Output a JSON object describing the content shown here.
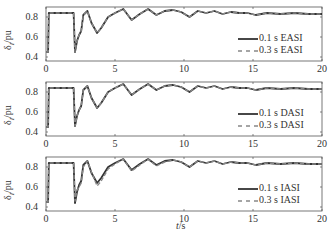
{
  "chart_data": [
    {
      "type": "line",
      "title": "",
      "xlabel": "",
      "ylabel": "δ/pu",
      "ylabel_subscript": "",
      "xlim": [
        0,
        20
      ],
      "ylim": [
        0.36,
        0.9
      ],
      "xticks": [
        "0",
        "5",
        "10",
        "15",
        "20"
      ],
      "yticks": [
        "0.4",
        "0.6",
        "0.8"
      ],
      "legend_position": "lower right",
      "series": [
        {
          "name": "0.1 s EASI",
          "style": "solid",
          "x": [
            0,
            0.15,
            0.2,
            2.0,
            2.1,
            2.25,
            2.4,
            2.55,
            2.7,
            3.0,
            3.3,
            3.7,
            4.0,
            4.5,
            5.0,
            5.6,
            6.2,
            6.8,
            7.4,
            8.0,
            8.6,
            9.2,
            9.8,
            10.4,
            11.0,
            11.6,
            12.2,
            12.8,
            13.4,
            14.0,
            14.6,
            15.2,
            16,
            17,
            18,
            19,
            20
          ],
          "y": [
            0.45,
            0.45,
            0.84,
            0.84,
            0.45,
            0.56,
            0.62,
            0.66,
            0.82,
            0.86,
            0.74,
            0.64,
            0.69,
            0.8,
            0.84,
            0.88,
            0.77,
            0.83,
            0.88,
            0.82,
            0.86,
            0.87,
            0.85,
            0.8,
            0.86,
            0.84,
            0.86,
            0.83,
            0.85,
            0.84,
            0.84,
            0.82,
            0.84,
            0.83,
            0.84,
            0.83,
            0.83
          ]
        },
        {
          "name": "0.3 s EASI",
          "style": "dashed",
          "x": [
            0,
            0.15,
            0.2,
            2.0,
            2.1,
            2.25,
            2.4,
            2.55,
            2.7,
            3.0,
            3.3,
            3.7,
            4.0,
            4.5,
            5.0,
            5.6,
            6.2,
            6.8,
            7.4,
            8.0,
            8.6,
            9.2,
            9.8,
            10.4,
            11.0,
            11.6,
            12.2,
            12.8,
            13.4,
            14.0,
            14.6,
            15.2,
            16,
            17,
            18,
            19,
            20
          ],
          "y": [
            0.45,
            0.45,
            0.84,
            0.84,
            0.45,
            0.56,
            0.62,
            0.66,
            0.82,
            0.86,
            0.74,
            0.64,
            0.69,
            0.8,
            0.84,
            0.88,
            0.77,
            0.83,
            0.88,
            0.82,
            0.86,
            0.87,
            0.85,
            0.8,
            0.86,
            0.84,
            0.86,
            0.83,
            0.85,
            0.84,
            0.84,
            0.82,
            0.84,
            0.83,
            0.84,
            0.83,
            0.83
          ]
        }
      ]
    },
    {
      "type": "line",
      "title": "",
      "xlabel": "",
      "ylabel": "δ/pu",
      "xlim": [
        0,
        20
      ],
      "ylim": [
        0.36,
        0.9
      ],
      "xticks": [
        "0",
        "5",
        "10",
        "15",
        "20"
      ],
      "yticks": [
        "0.4",
        "0.6",
        "0.8"
      ],
      "legend_position": "lower right",
      "series": [
        {
          "name": "0.1 s DASI",
          "style": "solid",
          "x": [
            0,
            0.15,
            0.2,
            2.0,
            2.1,
            2.25,
            2.4,
            2.55,
            2.7,
            3.0,
            3.3,
            3.7,
            4.0,
            4.5,
            5.0,
            5.6,
            6.2,
            6.8,
            7.4,
            8.0,
            8.6,
            9.2,
            9.8,
            10.4,
            11.0,
            11.6,
            12.2,
            12.8,
            13.4,
            14.0,
            14.6,
            15.2,
            16,
            17,
            18,
            19,
            20
          ],
          "y": [
            0.45,
            0.45,
            0.84,
            0.84,
            0.46,
            0.56,
            0.62,
            0.66,
            0.82,
            0.86,
            0.74,
            0.64,
            0.69,
            0.8,
            0.84,
            0.88,
            0.77,
            0.83,
            0.88,
            0.82,
            0.86,
            0.87,
            0.85,
            0.8,
            0.86,
            0.84,
            0.86,
            0.83,
            0.85,
            0.84,
            0.84,
            0.82,
            0.84,
            0.83,
            0.84,
            0.83,
            0.83
          ]
        },
        {
          "name": "0.3 s DASI",
          "style": "dashed",
          "x": [
            0,
            0.15,
            0.2,
            2.0,
            2.1,
            2.25,
            2.4,
            2.55,
            2.7,
            3.0,
            3.3,
            3.7,
            4.0,
            4.5,
            5.0,
            5.6,
            6.2,
            6.8,
            7.4,
            8.0,
            8.6,
            9.2,
            9.8,
            10.4,
            11.0,
            11.6,
            12.2,
            12.8,
            13.4,
            14.0,
            14.6,
            15.2,
            16,
            17,
            18,
            19,
            20
          ],
          "y": [
            0.45,
            0.45,
            0.84,
            0.84,
            0.46,
            0.56,
            0.62,
            0.66,
            0.82,
            0.86,
            0.74,
            0.64,
            0.69,
            0.8,
            0.84,
            0.88,
            0.77,
            0.83,
            0.88,
            0.82,
            0.86,
            0.87,
            0.85,
            0.8,
            0.86,
            0.84,
            0.86,
            0.83,
            0.85,
            0.84,
            0.84,
            0.82,
            0.84,
            0.83,
            0.84,
            0.83,
            0.83
          ]
        }
      ]
    },
    {
      "type": "line",
      "title": "",
      "xlabel": "t/s",
      "ylabel": "δ/pu",
      "xlim": [
        0,
        20
      ],
      "ylim": [
        0.36,
        0.9
      ],
      "xticks": [
        "0",
        "5",
        "10",
        "15",
        "20"
      ],
      "yticks": [
        "0.4",
        "0.6",
        "0.8"
      ],
      "legend_position": "lower right",
      "series": [
        {
          "name": "0.1 s IASI",
          "style": "solid",
          "x": [
            0,
            0.15,
            0.2,
            2.0,
            2.1,
            2.25,
            2.4,
            2.55,
            2.7,
            3.0,
            3.3,
            3.7,
            4.0,
            4.5,
            5.0,
            5.6,
            6.2,
            6.8,
            7.4,
            8.0,
            8.6,
            9.2,
            9.8,
            10.4,
            11.0,
            11.6,
            12.2,
            12.8,
            13.4,
            14.0,
            14.6,
            15.2,
            16,
            17,
            18,
            19,
            20
          ],
          "y": [
            0.45,
            0.45,
            0.84,
            0.84,
            0.44,
            0.55,
            0.62,
            0.66,
            0.82,
            0.86,
            0.74,
            0.64,
            0.69,
            0.8,
            0.84,
            0.88,
            0.77,
            0.83,
            0.88,
            0.82,
            0.86,
            0.87,
            0.85,
            0.8,
            0.86,
            0.84,
            0.86,
            0.83,
            0.85,
            0.84,
            0.84,
            0.82,
            0.84,
            0.83,
            0.84,
            0.83,
            0.83
          ]
        },
        {
          "name": "0.3 s IASI",
          "style": "dashed",
          "x": [
            0,
            0.15,
            0.2,
            2.0,
            2.1,
            2.25,
            2.4,
            2.55,
            2.7,
            3.0,
            3.3,
            3.7,
            4.0,
            4.5,
            5.0,
            5.6,
            6.2,
            6.8,
            7.4,
            8.0,
            8.6,
            9.2,
            9.8,
            10.4,
            11.0,
            11.6,
            12.2,
            12.8,
            13.4,
            14.0,
            14.6,
            15.2,
            16,
            17,
            18,
            19,
            20
          ],
          "y": [
            0.45,
            0.45,
            0.84,
            0.84,
            0.46,
            0.57,
            0.6,
            0.64,
            0.8,
            0.86,
            0.75,
            0.61,
            0.66,
            0.78,
            0.83,
            0.88,
            0.76,
            0.82,
            0.88,
            0.81,
            0.85,
            0.87,
            0.85,
            0.8,
            0.86,
            0.84,
            0.86,
            0.83,
            0.85,
            0.84,
            0.84,
            0.82,
            0.84,
            0.83,
            0.84,
            0.83,
            0.83
          ]
        }
      ]
    }
  ],
  "panels": [
    {
      "ylabel_main": "δ",
      "ylabel_sub": "I",
      "ylabel_unit": "/pu",
      "yticks": [
        "0.8",
        "0.6",
        "0.4"
      ],
      "xticks": [
        "0",
        "5",
        "10",
        "15",
        "20"
      ],
      "legend": [
        "0.1 s EASI",
        "0.3 s EASI"
      ]
    },
    {
      "ylabel_main": "δ",
      "ylabel_sub": "I",
      "ylabel_unit": "/pu",
      "yticks": [
        "0.8",
        "0.6",
        "0.4"
      ],
      "xticks": [
        "0",
        "5",
        "10",
        "15",
        "20"
      ],
      "legend": [
        "0.1 s DASI",
        "0.3 s DASI"
      ]
    },
    {
      "ylabel_main": "δ",
      "ylabel_sub": "I",
      "ylabel_unit": "/pu",
      "yticks": [
        "0.8",
        "0.6",
        "0.4"
      ],
      "xticks": [
        "0",
        "5",
        "10",
        "15",
        "20"
      ],
      "legend": [
        "0.1 s IASI",
        "0.3 s IASI"
      ]
    }
  ],
  "xaxis_label": {
    "var": "t",
    "unit": "/s"
  },
  "colors": {
    "line": "#333333",
    "dashed": "#888888",
    "frame": "#555555"
  }
}
